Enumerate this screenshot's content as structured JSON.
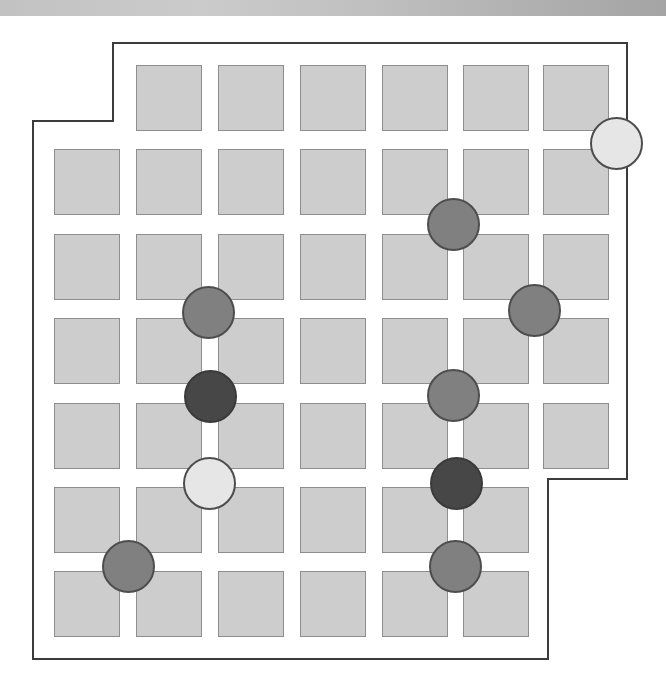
{
  "board": {
    "columns_x": [
      54,
      136,
      218,
      300,
      382,
      463,
      543
    ],
    "rows_y": [
      65,
      149,
      234,
      318,
      403,
      487,
      571
    ],
    "cell_size": 66,
    "cells": [
      {
        "row": 0,
        "col": 1
      },
      {
        "row": 0,
        "col": 2
      },
      {
        "row": 0,
        "col": 3
      },
      {
        "row": 0,
        "col": 4
      },
      {
        "row": 0,
        "col": 5
      },
      {
        "row": 0,
        "col": 6
      },
      {
        "row": 1,
        "col": 0
      },
      {
        "row": 1,
        "col": 1
      },
      {
        "row": 1,
        "col": 2
      },
      {
        "row": 1,
        "col": 3
      },
      {
        "row": 1,
        "col": 4
      },
      {
        "row": 1,
        "col": 5
      },
      {
        "row": 1,
        "col": 6
      },
      {
        "row": 2,
        "col": 0
      },
      {
        "row": 2,
        "col": 1
      },
      {
        "row": 2,
        "col": 2
      },
      {
        "row": 2,
        "col": 3
      },
      {
        "row": 2,
        "col": 4
      },
      {
        "row": 2,
        "col": 5
      },
      {
        "row": 2,
        "col": 6
      },
      {
        "row": 3,
        "col": 0
      },
      {
        "row": 3,
        "col": 1
      },
      {
        "row": 3,
        "col": 2
      },
      {
        "row": 3,
        "col": 3
      },
      {
        "row": 3,
        "col": 4
      },
      {
        "row": 3,
        "col": 5
      },
      {
        "row": 3,
        "col": 6
      },
      {
        "row": 4,
        "col": 0
      },
      {
        "row": 4,
        "col": 1
      },
      {
        "row": 4,
        "col": 2
      },
      {
        "row": 4,
        "col": 3
      },
      {
        "row": 4,
        "col": 4
      },
      {
        "row": 4,
        "col": 5
      },
      {
        "row": 4,
        "col": 6
      },
      {
        "row": 5,
        "col": 0
      },
      {
        "row": 5,
        "col": 1
      },
      {
        "row": 5,
        "col": 2
      },
      {
        "row": 5,
        "col": 3
      },
      {
        "row": 5,
        "col": 4
      },
      {
        "row": 5,
        "col": 5
      },
      {
        "row": 6,
        "col": 0
      },
      {
        "row": 6,
        "col": 1
      },
      {
        "row": 6,
        "col": 2
      },
      {
        "row": 6,
        "col": 3
      },
      {
        "row": 6,
        "col": 4
      },
      {
        "row": 6,
        "col": 5
      }
    ],
    "outline_points": "33,121 113,121 113,43 627,43 627,479 548,479 548,659 33,659",
    "colors": {
      "cell_fill": "#cdcdcd",
      "cell_border": "#8e8e8e",
      "outline": "#3c3c3c",
      "piece_light": "#e6e6e6",
      "piece_medium": "#808080",
      "piece_dark": "#474747"
    }
  },
  "pieces": [
    {
      "shade": "light",
      "cx": 616,
      "cy": 143
    },
    {
      "shade": "medium",
      "cx": 453,
      "cy": 224
    },
    {
      "shade": "medium",
      "cx": 208,
      "cy": 312
    },
    {
      "shade": "medium",
      "cx": 534,
      "cy": 310
    },
    {
      "shade": "dark",
      "cx": 210,
      "cy": 396
    },
    {
      "shade": "medium",
      "cx": 453,
      "cy": 395
    },
    {
      "shade": "light",
      "cx": 209,
      "cy": 483
    },
    {
      "shade": "dark",
      "cx": 456,
      "cy": 483
    },
    {
      "shade": "medium",
      "cx": 128,
      "cy": 566
    },
    {
      "shade": "medium",
      "cx": 455,
      "cy": 566
    }
  ]
}
